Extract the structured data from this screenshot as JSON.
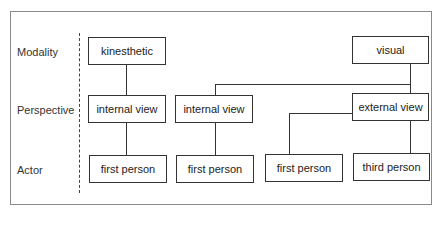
{
  "diagram": {
    "row_labels": {
      "modality": "Modality",
      "perspective": "Perspective",
      "actor": "Actor"
    },
    "nodes": {
      "kinesthetic": "kinesthetic",
      "visual": "visual",
      "internal_view_1": "internal view",
      "internal_view_2": "internal view",
      "external_view": "external view",
      "first_person_1": "first person",
      "first_person_2": "first person",
      "first_person_3": "first person",
      "third_person": "third person"
    },
    "edges": [
      [
        "kinesthetic",
        "internal_view_1"
      ],
      [
        "visual",
        "internal_view_2"
      ],
      [
        "visual",
        "external_view"
      ],
      [
        "internal_view_1",
        "first_person_1"
      ],
      [
        "internal_view_2",
        "first_person_2"
      ],
      [
        "external_view",
        "first_person_3"
      ],
      [
        "external_view",
        "third_person"
      ]
    ],
    "colors": {
      "line": "#333333",
      "frame": "#8a8a8a",
      "background": "#ffffff"
    }
  }
}
